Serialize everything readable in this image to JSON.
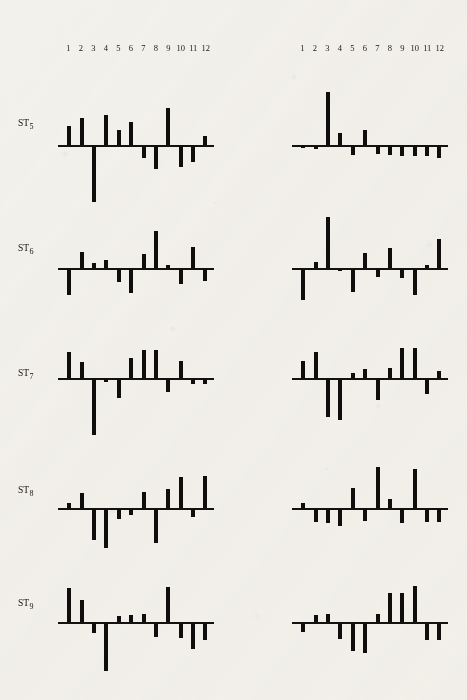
{
  "figure": {
    "tick_labels": [
      "1",
      "2",
      "3",
      "4",
      "5",
      "6",
      "7",
      "8",
      "9",
      "10",
      "11",
      "12"
    ],
    "bar_color": "#100e0c",
    "paper_color": "#f3f1ec",
    "axis_color": "#141210"
  },
  "columns": [
    {
      "id": "left",
      "header_id": "numbers-left"
    },
    {
      "id": "right",
      "header_id": "numbers-right"
    }
  ],
  "rows": [
    {
      "label": "ST",
      "sub": "5"
    },
    {
      "label": "ST",
      "sub": "6"
    },
    {
      "label": "ST",
      "sub": "7"
    },
    {
      "label": "ST",
      "sub": "8"
    },
    {
      "label": "ST",
      "sub": "9"
    }
  ],
  "chart_data": {
    "type": "bar",
    "title": "",
    "subtitle": "",
    "xlabel": "",
    "ylabel": "",
    "grid": false,
    "legend": "none",
    "categories": [
      "1",
      "2",
      "3",
      "4",
      "5",
      "6",
      "7",
      "8",
      "9",
      "10",
      "11",
      "12"
    ],
    "ylim": [
      -100,
      100
    ],
    "note": "Ten deviation (residual) bar panels arranged as 5 rows (ST5-ST9) by 2 columns; bars extend above/below a common zero baseline. Values are percentages of the panel half-height read off the scan.",
    "panels": [
      {
        "row": "ST5",
        "column": "left",
        "values": [
          32,
          46,
          -96,
          52,
          26,
          40,
          -20,
          -40,
          64,
          -36,
          -28,
          16
        ]
      },
      {
        "row": "ST5",
        "column": "right",
        "values": [
          -4,
          -5,
          92,
          20,
          -16,
          26,
          -14,
          -16,
          -18,
          -18,
          -18,
          -20
        ]
      },
      {
        "row": "ST6",
        "column": "left",
        "values": [
          -44,
          28,
          8,
          14,
          -22,
          -42,
          24,
          64,
          6,
          -26,
          36,
          -20
        ]
      },
      {
        "row": "ST6",
        "column": "right",
        "values": [
          -54,
          10,
          88,
          -4,
          -40,
          26,
          -14,
          34,
          -16,
          -44,
          6,
          50
        ]
      },
      {
        "row": "ST7",
        "column": "left",
        "values": [
          44,
          28,
          -96,
          -6,
          -32,
          34,
          48,
          48,
          -22,
          30,
          -8,
          -8
        ]
      },
      {
        "row": "ST7",
        "column": "right",
        "values": [
          30,
          44,
          -66,
          -70,
          8,
          16,
          -36,
          18,
          52,
          52,
          -26,
          12
        ]
      },
      {
        "row": "ST8",
        "column": "left",
        "values": [
          8,
          26,
          -54,
          -68,
          -18,
          -10,
          28,
          -58,
          32,
          54,
          -14,
          56
        ]
      },
      {
        "row": "ST8",
        "column": "right",
        "values": [
          8,
          -22,
          -24,
          -30,
          34,
          -20,
          70,
          16,
          -24,
          68,
          -22,
          -22
        ]
      },
      {
        "row": "ST9",
        "column": "left",
        "values": [
          58,
          38,
          -18,
          -82,
          10,
          12,
          14,
          -24,
          60,
          -26,
          -44,
          -30
        ]
      },
      {
        "row": "ST9",
        "column": "right",
        "values": [
          -16,
          12,
          14,
          -28,
          -48,
          -52,
          14,
          50,
          50,
          62,
          -30,
          -30
        ]
      }
    ]
  }
}
